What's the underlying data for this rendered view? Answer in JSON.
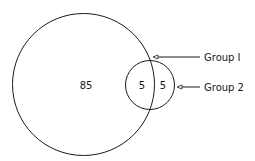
{
  "diagram": {
    "type": "venn",
    "sets": [
      {
        "name": "Group 1",
        "label": "Group I"
      },
      {
        "name": "Group 2",
        "label": "Group 2"
      }
    ],
    "regions": {
      "group1_only": "85",
      "intersection": "5",
      "group2_only": "5"
    },
    "stroke_color": "#1a1a1a"
  }
}
